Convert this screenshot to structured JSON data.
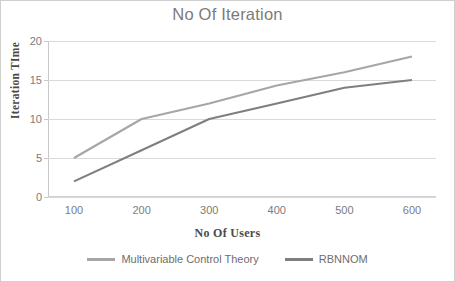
{
  "chart_data": {
    "type": "line",
    "title": "No Of Iteration",
    "xlabel": "No Of Users",
    "ylabel": "Iteration TIme",
    "x": [
      100,
      200,
      300,
      400,
      500,
      600
    ],
    "categories": [
      "100",
      "200",
      "300",
      "400",
      "500",
      "600"
    ],
    "xtick_labels": [
      "100",
      "200",
      "300",
      "400",
      "500",
      "600"
    ],
    "ytick_labels": [
      "0",
      "5",
      "10",
      "15",
      "20"
    ],
    "yticks": [
      0,
      5,
      10,
      15,
      20
    ],
    "ylim": [
      0,
      20
    ],
    "xlim": [
      100,
      600
    ],
    "grid": "horizontal",
    "legend_position": "bottom",
    "series": [
      {
        "name": "Multivariable Control Theory",
        "color": "#a6a6a6",
        "values": [
          5,
          10,
          12,
          14.3,
          16,
          18
        ]
      },
      {
        "name": "RBNNOM",
        "color": "#7f7f7f",
        "values": [
          2,
          6,
          10,
          12,
          14,
          15
        ]
      }
    ]
  },
  "legend": {
    "items": [
      {
        "label": "Multivariable Control Theory",
        "color": "#a6a6a6"
      },
      {
        "label": "RBNNOM",
        "color": "#7f7f7f"
      }
    ]
  },
  "colors": {
    "series_1": "#a6a6a6",
    "series_2": "#7f7f7f",
    "gridline": "#d9d9d9",
    "tick_text": "#7c7c7c",
    "title_text": "#7b7b7b",
    "axis_title_text": "#4a4a4a",
    "border": "#cfcfcf",
    "background": "#ffffff"
  }
}
